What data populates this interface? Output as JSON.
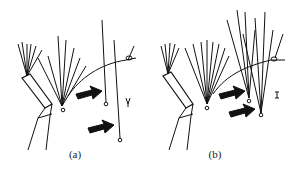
{
  "figure": {
    "panels": [
      {
        "id": "a",
        "caption": "(a)",
        "description": "Plant stem with tuft of hairs; two arrows pointing to two detached single hairs with basal rings; small insect glyph"
      },
      {
        "id": "b",
        "caption": "(b)",
        "description": "Plant stem with tuft of hairs; two arrows pointing to two detached hair tufts with basal rings; small insect glyph"
      }
    ],
    "colors": {
      "ink": "#111111",
      "background": "#ffffff"
    }
  }
}
